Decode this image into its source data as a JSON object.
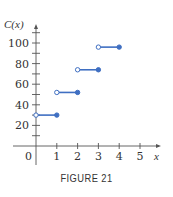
{
  "chart_data": {
    "type": "line",
    "subtype": "step",
    "title": "",
    "caption": "FIGURE 21",
    "xlabel": "x",
    "ylabel": "C(x)",
    "xlim": [
      0,
      5
    ],
    "ylim": [
      0,
      110
    ],
    "x_ticks": [
      1,
      2,
      3,
      4,
      5
    ],
    "x_tick_labels": [
      "1",
      "2",
      "3",
      "4",
      "5"
    ],
    "origin_label": "0",
    "y_ticks": [
      10,
      20,
      30,
      40,
      50,
      60,
      70,
      80,
      90,
      100,
      110
    ],
    "y_tick_labels": [
      {
        "value": 20,
        "label": "20"
      },
      {
        "value": 40,
        "label": "40"
      },
      {
        "value": 60,
        "label": "60"
      },
      {
        "value": 80,
        "label": "80"
      },
      {
        "value": 100,
        "label": "100"
      }
    ],
    "grid": false,
    "legend": null,
    "series": [
      {
        "name": "C(x)",
        "color": "#3f6fc2",
        "segments": [
          {
            "x_start": 0,
            "x_end": 1,
            "y": 30,
            "start_open": true,
            "end_closed": true
          },
          {
            "x_start": 1,
            "x_end": 2,
            "y": 52,
            "start_open": true,
            "end_closed": true
          },
          {
            "x_start": 2,
            "x_end": 3,
            "y": 74,
            "start_open": true,
            "end_closed": true
          },
          {
            "x_start": 3,
            "x_end": 4,
            "y": 96,
            "start_open": true,
            "end_closed": true
          }
        ]
      }
    ]
  },
  "colors": {
    "series": "#3f6fc2",
    "axis": "#555555",
    "text": "#333333"
  }
}
